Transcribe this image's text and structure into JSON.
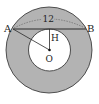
{
  "diagram": {
    "type": "annulus-chord-tangent",
    "labels": {
      "A": "A",
      "B": "B",
      "H": "H",
      "O": "O",
      "chord_length": "12"
    },
    "colors": {
      "ring_fill": "#b3b3b3",
      "inner_fill": "#ffffff",
      "stroke": "#2a2a2a",
      "arc_dashed": "#666666"
    },
    "geometry": {
      "center": [
        49,
        50
      ],
      "outer_radius": 43,
      "inner_radius": 21,
      "chord_y": 29
    }
  }
}
